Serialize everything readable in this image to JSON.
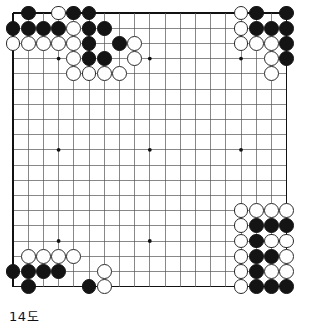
{
  "figure": {
    "caption": "14도",
    "type": "go-board-diagram"
  },
  "board": {
    "size": 19,
    "origin_x": 13,
    "origin_y": 13,
    "spacing": 15.2,
    "stone_radius": 7.4,
    "line_color": "#555555",
    "border_color": "#111111",
    "background_color": "#ffffff",
    "black_color": "#141414",
    "white_color": "#ffffff",
    "white_outline_color": "#2a2a2a",
    "star_points": [
      [
        3,
        3
      ],
      [
        9,
        3
      ],
      [
        15,
        3
      ],
      [
        3,
        9
      ],
      [
        9,
        9
      ],
      [
        15,
        9
      ],
      [
        3,
        15
      ],
      [
        9,
        15
      ],
      [
        15,
        15
      ]
    ],
    "stones": [
      {
        "color": "black",
        "col": 1,
        "row": 0
      },
      {
        "color": "white",
        "col": 3,
        "row": 0
      },
      {
        "color": "black",
        "col": 4,
        "row": 0
      },
      {
        "color": "black",
        "col": 5,
        "row": 0
      },
      {
        "color": "black",
        "col": 0,
        "row": 1
      },
      {
        "color": "black",
        "col": 1,
        "row": 1
      },
      {
        "color": "black",
        "col": 2,
        "row": 1
      },
      {
        "color": "black",
        "col": 3,
        "row": 1
      },
      {
        "color": "white",
        "col": 4,
        "row": 1
      },
      {
        "color": "black",
        "col": 5,
        "row": 1
      },
      {
        "color": "black",
        "col": 6,
        "row": 1
      },
      {
        "color": "white",
        "col": 0,
        "row": 2
      },
      {
        "color": "white",
        "col": 1,
        "row": 2
      },
      {
        "color": "white",
        "col": 2,
        "row": 2
      },
      {
        "color": "white",
        "col": 3,
        "row": 2
      },
      {
        "color": "white",
        "col": 4,
        "row": 2
      },
      {
        "color": "black",
        "col": 5,
        "row": 2
      },
      {
        "color": "black",
        "col": 7,
        "row": 2
      },
      {
        "color": "white",
        "col": 8,
        "row": 2
      },
      {
        "color": "white",
        "col": 4,
        "row": 3
      },
      {
        "color": "black",
        "col": 5,
        "row": 3
      },
      {
        "color": "black",
        "col": 6,
        "row": 3
      },
      {
        "color": "white",
        "col": 8,
        "row": 3
      },
      {
        "color": "white",
        "col": 4,
        "row": 4
      },
      {
        "color": "white",
        "col": 5,
        "row": 4
      },
      {
        "color": "white",
        "col": 6,
        "row": 4
      },
      {
        "color": "white",
        "col": 7,
        "row": 4
      },
      {
        "color": "white",
        "col": 15,
        "row": 0
      },
      {
        "color": "black",
        "col": 16,
        "row": 0
      },
      {
        "color": "black",
        "col": 18,
        "row": 0
      },
      {
        "color": "white",
        "col": 15,
        "row": 1
      },
      {
        "color": "black",
        "col": 16,
        "row": 1
      },
      {
        "color": "black",
        "col": 17,
        "row": 1
      },
      {
        "color": "black",
        "col": 18,
        "row": 1
      },
      {
        "color": "white",
        "col": 15,
        "row": 2
      },
      {
        "color": "white",
        "col": 16,
        "row": 2
      },
      {
        "color": "white",
        "col": 17,
        "row": 2
      },
      {
        "color": "black",
        "col": 18,
        "row": 2
      },
      {
        "color": "white",
        "col": 17,
        "row": 3
      },
      {
        "color": "black",
        "col": 18,
        "row": 3
      },
      {
        "color": "white",
        "col": 17,
        "row": 4
      },
      {
        "color": "white",
        "col": 16,
        "row": 13
      },
      {
        "color": "white",
        "col": 17,
        "row": 13
      },
      {
        "color": "white",
        "col": 18,
        "row": 13
      },
      {
        "color": "white",
        "col": 15,
        "row": 13
      },
      {
        "color": "white",
        "col": 15,
        "row": 14
      },
      {
        "color": "black",
        "col": 16,
        "row": 14
      },
      {
        "color": "black",
        "col": 17,
        "row": 14
      },
      {
        "color": "black",
        "col": 18,
        "row": 14
      },
      {
        "color": "white",
        "col": 15,
        "row": 15
      },
      {
        "color": "black",
        "col": 16,
        "row": 15
      },
      {
        "color": "white",
        "col": 17,
        "row": 15
      },
      {
        "color": "white",
        "col": 18,
        "row": 15
      },
      {
        "color": "white",
        "col": 15,
        "row": 16
      },
      {
        "color": "black",
        "col": 16,
        "row": 16
      },
      {
        "color": "black",
        "col": 17,
        "row": 16
      },
      {
        "color": "white",
        "col": 18,
        "row": 16
      },
      {
        "color": "white",
        "col": 15,
        "row": 17
      },
      {
        "color": "black",
        "col": 16,
        "row": 17
      },
      {
        "color": "white",
        "col": 17,
        "row": 17
      },
      {
        "color": "white",
        "col": 18,
        "row": 17
      },
      {
        "color": "white",
        "col": 15,
        "row": 18
      },
      {
        "color": "black",
        "col": 16,
        "row": 18
      },
      {
        "color": "black",
        "col": 17,
        "row": 18
      },
      {
        "color": "black",
        "col": 18,
        "row": 18
      },
      {
        "color": "white",
        "col": 1,
        "row": 16
      },
      {
        "color": "white",
        "col": 2,
        "row": 16
      },
      {
        "color": "white",
        "col": 3,
        "row": 16
      },
      {
        "color": "white",
        "col": 4,
        "row": 16
      },
      {
        "color": "black",
        "col": 0,
        "row": 17
      },
      {
        "color": "black",
        "col": 1,
        "row": 17
      },
      {
        "color": "black",
        "col": 2,
        "row": 17
      },
      {
        "color": "black",
        "col": 3,
        "row": 17
      },
      {
        "color": "white",
        "col": 6,
        "row": 17
      },
      {
        "color": "black",
        "col": 1,
        "row": 18
      },
      {
        "color": "black",
        "col": 5,
        "row": 18
      },
      {
        "color": "white",
        "col": 6,
        "row": 18
      }
    ]
  }
}
